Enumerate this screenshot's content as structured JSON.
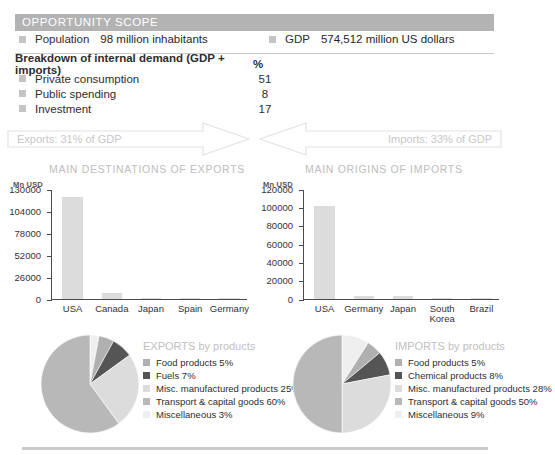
{
  "header": {
    "title": "OPPORTUNITY SCOPE",
    "bar_color": "#b3b3b3"
  },
  "facts": [
    {
      "label": "Population",
      "value": "98 million inhabitants"
    },
    {
      "label": "GDP",
      "value": "574,512 million US dollars"
    }
  ],
  "breakdown": {
    "title": "Breakdown of internal demand (GDP + imports)",
    "unit": "%",
    "rows": [
      {
        "label": "Private consumption",
        "value": "51"
      },
      {
        "label": "Public spending",
        "value": "8"
      },
      {
        "label": "Investment",
        "value": "17"
      }
    ]
  },
  "arrows": {
    "exports": "Exports: 31% of GDP",
    "imports": "Imports: 33% of GDP"
  },
  "charts": {
    "exports": {
      "title": "MAIN DESTINATIONS OF EXPORTS",
      "unit": "Mn USD"
    },
    "imports": {
      "title": "MAIN ORIGINS OF IMPORTS",
      "unit": "Mn USD"
    }
  },
  "chart_data": [
    {
      "type": "bar",
      "title": "MAIN DESTINATIONS OF EXPORTS",
      "ylabel": "Mn USD",
      "xlabel": "",
      "categories": [
        "USA",
        "Canada",
        "Japan",
        "Spain",
        "Germany"
      ],
      "values": [
        120000,
        7000,
        600,
        400,
        400
      ],
      "ylim": [
        0,
        130000
      ],
      "yticks": [
        0,
        26000,
        52000,
        78000,
        104000,
        130000
      ],
      "ytick_labels": [
        "0",
        "26000",
        "52000",
        "78000",
        "104000",
        "130000"
      ],
      "grid": false,
      "legend": "none",
      "bar_color": "#dcdcdc"
    },
    {
      "type": "bar",
      "title": "MAIN ORIGINS OF IMPORTS",
      "ylabel": "Mn USD",
      "xlabel": "",
      "categories": [
        "USA",
        "Germany",
        "Japan",
        "South Korea",
        "Brazil"
      ],
      "values": [
        101000,
        3500,
        3000,
        1500,
        900
      ],
      "ylim": [
        0,
        120000
      ],
      "yticks": [
        0,
        20000,
        40000,
        60000,
        80000,
        100000,
        120000
      ],
      "ytick_labels": [
        "0",
        "20000",
        "40000",
        "60000",
        "80000",
        "100000",
        "120000"
      ],
      "grid": false,
      "legend": "none",
      "bar_color": "#dcdcdc"
    },
    {
      "type": "pie",
      "title": "EXPORTS by products",
      "labels": [
        "Food products 5%",
        "Fuels 7%",
        "Misc. manufactured products 25%",
        "Transport & capital goods 60%",
        "Miscellaneous 3%"
      ],
      "slice_names": [
        "Food products",
        "Fuels",
        "Misc. manufactured products",
        "Transport & capital goods",
        "Miscellaneous"
      ],
      "values": [
        5,
        7,
        25,
        60,
        3
      ],
      "colors": [
        "#b0b0b0",
        "#555555",
        "#dcdcdc",
        "#b8b8b8",
        "#efefef"
      ],
      "legend": "right"
    },
    {
      "type": "pie",
      "title": "IMPORTS by products",
      "labels": [
        "Food products 5%",
        "Chemical products 8%",
        "Misc. manufactured products 28%",
        "Transport & capital goods 50%",
        "Miscellaneous 9%"
      ],
      "slice_names": [
        "Food products",
        "Chemical products",
        "Misc. manufactured products",
        "Transport & capital goods",
        "Miscellaneous"
      ],
      "values": [
        5,
        8,
        28,
        50,
        9
      ],
      "colors": [
        "#b0b0b0",
        "#555555",
        "#dcdcdc",
        "#b8b8b8",
        "#efefef"
      ],
      "legend": "right"
    }
  ]
}
